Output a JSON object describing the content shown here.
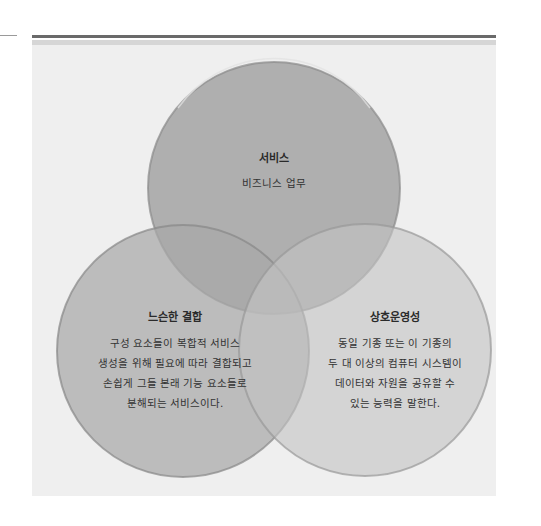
{
  "diagram": {
    "type": "venn",
    "colors": {
      "panel_bg": "#efefef",
      "top_rule": "#6a6a6a",
      "stripe": "#d6d6d6",
      "circle_top": "#a6a6a6",
      "circle_left": "#b2b2b2",
      "circle_right": "#cbcbcb"
    },
    "circles": [
      {
        "id": "service",
        "title": "서비스",
        "lines": [
          "비즈니스 업무"
        ]
      },
      {
        "id": "loose-coupling",
        "title": "느슨한 결합",
        "lines": [
          "구성 요소들이 복합적 서비스",
          "생성을 위해 필요에 따라 결합되고",
          "손쉽게 그들 본래 기능 요소들로",
          "분해되는 서비스이다."
        ]
      },
      {
        "id": "interoperability",
        "title": "상호운영성",
        "lines": [
          "동일 기종 또는 이 기종의",
          "두 대 이상의 컴퓨터 시스템이",
          "데이터와 자원을 공유할 수",
          "있는 능력을 말한다."
        ]
      }
    ]
  }
}
